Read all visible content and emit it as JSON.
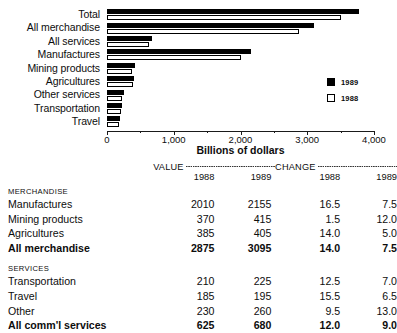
{
  "chart_data": {
    "type": "bar",
    "orientation": "horizontal",
    "title": "",
    "xlabel": "Billions of dollars",
    "ylabel": "",
    "xlim": [
      0,
      4000
    ],
    "xticks": [
      "0",
      "1,000",
      "2,000",
      "3,000",
      "4,000"
    ],
    "xtick_values": [
      0,
      1000,
      2000,
      3000,
      4000
    ],
    "grid": false,
    "legend_position": "right",
    "categories": [
      "Total",
      "All merchandise",
      "All services",
      "Manufactures",
      "Mining products",
      "Agricultures",
      "Other services",
      "Transportation",
      "Travel"
    ],
    "series": [
      {
        "name": "1989",
        "color": "#000000",
        "values": [
          3775,
          3095,
          680,
          2155,
          415,
          405,
          260,
          225,
          195
        ]
      },
      {
        "name": "1988",
        "color": "#ffffff",
        "values": [
          3500,
          2875,
          625,
          2010,
          370,
          385,
          230,
          210,
          185
        ]
      }
    ]
  },
  "legend": {
    "items": [
      {
        "label": "1989",
        "swatch": "filled"
      },
      {
        "label": "1988",
        "swatch": "open"
      }
    ]
  },
  "axis": {
    "title": "Billions of dollars"
  },
  "table": {
    "group_headers": [
      {
        "label": "VALUE"
      },
      {
        "label": "CHANGE"
      }
    ],
    "sub_headers": [
      "1988",
      "1989",
      "1988",
      "1989"
    ],
    "sections": [
      {
        "title": "MERCHANDISE",
        "rows": [
          {
            "label": "Manufactures",
            "v88": "2010",
            "v89": "2155",
            "c88": "16.5",
            "c89": "7.5",
            "bold": false
          },
          {
            "label": "Mining products",
            "v88": "370",
            "v89": "415",
            "c88": "1.5",
            "c89": "12.0",
            "bold": false
          },
          {
            "label": "Agricultures",
            "v88": "385",
            "v89": "405",
            "c88": "14.0",
            "c89": "5.0",
            "bold": false
          },
          {
            "label": "All merchandise",
            "v88": "2875",
            "v89": "3095",
            "c88": "14.0",
            "c89": "7.5",
            "bold": true
          }
        ]
      },
      {
        "title": "SERVICES",
        "rows": [
          {
            "label": "Transportation",
            "v88": "210",
            "v89": "225",
            "c88": "12.5",
            "c89": "7.0",
            "bold": false
          },
          {
            "label": "Travel",
            "v88": "185",
            "v89": "195",
            "c88": "15.5",
            "c89": "6.5",
            "bold": false
          },
          {
            "label": "Other",
            "v88": "230",
            "v89": "260",
            "c88": "9.5",
            "c89": "13.0",
            "bold": false
          },
          {
            "label": "All comm'l services",
            "v88": "625",
            "v89": "680",
            "c88": "12.0",
            "c89": "9.0",
            "bold": true
          }
        ]
      }
    ]
  }
}
